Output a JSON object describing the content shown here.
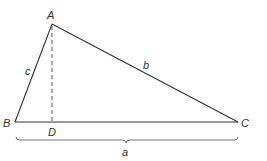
{
  "diagram": {
    "type": "triangle-with-altitude",
    "colors": {
      "stroke": "#333333",
      "dashed": "#555555",
      "brace": "#666666",
      "background": "#ffffff"
    },
    "vertices": {
      "A": {
        "label": "A",
        "x": 52,
        "y": 24
      },
      "B": {
        "label": "B",
        "x": 15,
        "y": 122
      },
      "C": {
        "label": "C",
        "x": 238,
        "y": 122
      },
      "D": {
        "label": "D",
        "x": 52,
        "y": 122
      }
    },
    "sides": {
      "a": {
        "label": "a",
        "from": "B",
        "to": "C"
      },
      "b": {
        "label": "b",
        "from": "A",
        "to": "C"
      },
      "c": {
        "label": "c",
        "from": "A",
        "to": "B"
      }
    },
    "altitude": {
      "from": "A",
      "to": "D",
      "style": "dashed"
    }
  }
}
